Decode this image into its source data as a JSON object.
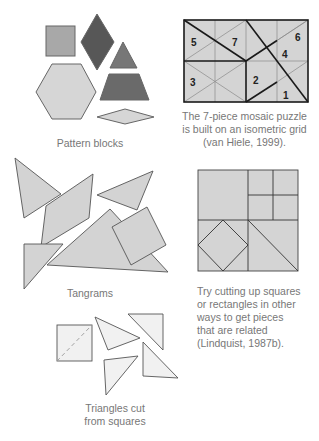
{
  "colors": {
    "light_fill": "#d4d4d4",
    "medium_fill": "#a9a9a9",
    "dark_fill": "#5e5e5e",
    "darker_fill": "#6e6e6e",
    "stroke": "#555555",
    "caption_text": "#777777"
  },
  "figures": {
    "pattern_blocks": {
      "caption": "Pattern blocks",
      "shapes": [
        "square",
        "rhombus-dark",
        "triangle",
        "hexagon",
        "trapezoid",
        "thin-rhombus"
      ]
    },
    "mosaic_puzzle": {
      "caption_lines": [
        "The 7-piece mosaic puzzle",
        "is built on an isometric grid",
        "(van Hiele, 1999)."
      ],
      "piece_labels": [
        "5",
        "7",
        "6",
        "4",
        "3",
        "2",
        "1"
      ]
    },
    "tangrams": {
      "caption": "Tangrams"
    },
    "cut_squares": {
      "caption_lines": [
        "Try cutting up squares",
        "or rectangles in other",
        "ways to get pieces",
        "that are related",
        "(Lindquist, 1987b)."
      ]
    },
    "triangles_from_squares": {
      "caption_lines": [
        "Triangles cut",
        "from squares"
      ]
    }
  }
}
